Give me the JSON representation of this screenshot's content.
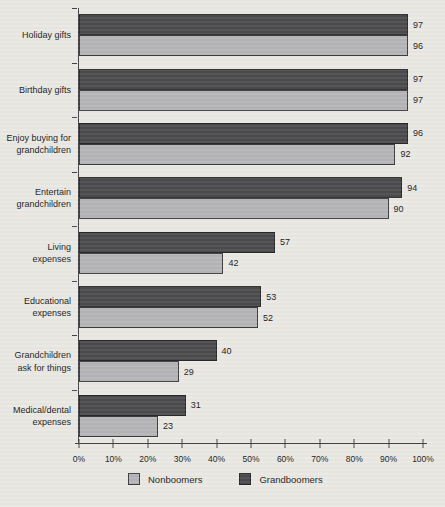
{
  "chart_data": {
    "type": "bar",
    "orientation": "horizontal",
    "title": "",
    "xlabel": "",
    "ylabel": "",
    "categories": [
      [
        "Holiday gifts"
      ],
      [
        "Birthday gifts"
      ],
      [
        "Enjoy buying for",
        "grandchildren"
      ],
      [
        "Entertain",
        "grandchildren"
      ],
      [
        "Living",
        "expenses"
      ],
      [
        "Educational",
        "expenses"
      ],
      [
        "Grandchildren",
        "ask for things"
      ],
      [
        "Medical/dental",
        "expenses"
      ]
    ],
    "series": [
      {
        "name": "Grandboomers",
        "color": "#4b4b4d",
        "values": [
          97,
          97,
          96,
          94,
          57,
          53,
          40,
          31
        ]
      },
      {
        "name": "Nonboomers",
        "color": "#b5b5b7",
        "values": [
          96,
          97,
          92,
          90,
          42,
          52,
          29,
          23
        ]
      }
    ],
    "bar_order_in_group": [
      "Grandboomers",
      "Nonboomers"
    ],
    "data_labels_shown": true,
    "xlim": [
      0,
      100
    ],
    "x_ticks": [
      "0%",
      "10%",
      "20%",
      "30%",
      "40%",
      "50%",
      "60%",
      "70%",
      "80%",
      "90%",
      "100%"
    ],
    "grid": false,
    "legend_position": "bottom",
    "legend": [
      {
        "label": "Nonboomers",
        "color": "#b5b5b7"
      },
      {
        "label": "Grandboomers",
        "color": "#4b4b4d"
      }
    ]
  },
  "colors": {
    "background": "#e9e8e3",
    "axis": "#444446",
    "text": "#1c1c1c",
    "dark_bar": "#4b4b4d",
    "light_bar": "#b5b5b7"
  }
}
